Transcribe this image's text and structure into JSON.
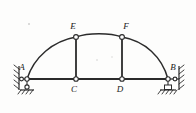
{
  "figure": {
    "type": "structural-diagram",
    "subtitle": "Three-hinged tied arch frame",
    "background_color": "#fdfdfc",
    "line_color": "#2b2b2b"
  },
  "labels": {
    "A": "A",
    "B": "B",
    "C": "C",
    "D": "D",
    "E": "E",
    "F": "F"
  },
  "nodes": [
    {
      "id": "A",
      "label": "A",
      "x": 27,
      "y": 79,
      "kind": "pin-support-hinge",
      "label_x": 22,
      "label_y": 70
    },
    {
      "id": "B",
      "label": "B",
      "x": 168,
      "y": 79,
      "kind": "pin-support-hinge",
      "label_x": 172,
      "label_y": 70
    },
    {
      "id": "C",
      "label": "C",
      "x": 76,
      "y": 79,
      "kind": "hinge",
      "label_x": 72,
      "label_y": 92
    },
    {
      "id": "D",
      "label": "D",
      "x": 122,
      "y": 79,
      "kind": "hinge",
      "label_x": 118,
      "label_y": 92
    },
    {
      "id": "E",
      "label": "E",
      "x": 76,
      "y": 37,
      "kind": "hinge",
      "label_x": 71,
      "label_y": 29
    },
    {
      "id": "F",
      "label": "F",
      "x": 122,
      "y": 37,
      "kind": "hinge",
      "label_x": 124,
      "label_y": 29
    }
  ],
  "members": [
    {
      "id": "arch-left",
      "from": "A",
      "to": "E",
      "kind": "curved-arch-rib"
    },
    {
      "id": "arch-crown",
      "from": "E",
      "to": "F",
      "kind": "curved-arch-rib"
    },
    {
      "id": "arch-right",
      "from": "F",
      "to": "B",
      "kind": "curved-arch-rib"
    },
    {
      "id": "tie-AC",
      "from": "A",
      "to": "C",
      "kind": "horizontal-tie"
    },
    {
      "id": "tie-CD",
      "from": "C",
      "to": "D",
      "kind": "horizontal-tie"
    },
    {
      "id": "tie-DB",
      "from": "D",
      "to": "B",
      "kind": "horizontal-tie"
    },
    {
      "id": "post-EC",
      "from": "E",
      "to": "C",
      "kind": "vertical-post"
    },
    {
      "id": "post-FD",
      "from": "F",
      "to": "D",
      "kind": "vertical-post"
    }
  ],
  "supports": {
    "left": {
      "node": "A",
      "wall_type": "hatched-vertical-wall",
      "ground_type": "hatched-ground-hinge"
    },
    "right": {
      "node": "B",
      "wall_type": "hatched-vertical-wall",
      "ground_type": "roller-on-hatched-ground"
    }
  },
  "icons": {
    "hinge": "hinge-circle-icon",
    "hatch": "hatch-support-icon",
    "roller": "roller-support-icon"
  }
}
